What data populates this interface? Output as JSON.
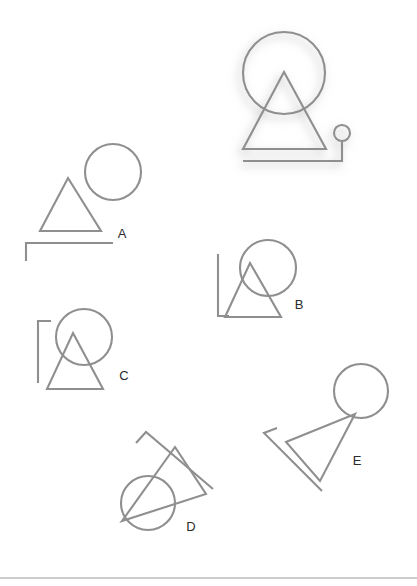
{
  "page": {
    "background_color": "#ffffff",
    "stroke_color": "#8f8f8f",
    "label_color": "#2b2b2b",
    "footer_rule_color": "#bdbdbd",
    "width": 417,
    "height": 586
  },
  "reference": {
    "name": "reference-figure",
    "has_shadow": true,
    "shadow_color": "#b0b0b0",
    "components": [
      {
        "type": "circle",
        "cx": 284,
        "cy": 73,
        "r": 41
      },
      {
        "type": "triangle",
        "apex_x": 284,
        "apex_y": 72,
        "left_x": 243,
        "right_x": 326,
        "base_y": 149
      },
      {
        "type": "line",
        "x1": 243,
        "y1": 161,
        "x2": 342,
        "y2": 161
      },
      {
        "type": "line",
        "x1": 342,
        "y1": 161,
        "x2": 342,
        "y2": 142
      },
      {
        "type": "circle",
        "cx": 342,
        "cy": 133,
        "r": 8
      }
    ]
  },
  "options": [
    {
      "id": "A",
      "label": "A",
      "label_x": 122,
      "label_y": 238,
      "description": "triangle with separate circle to upper right, horizontal bar below with downward tick at left end",
      "components": [
        {
          "type": "circle",
          "cx": 113,
          "cy": 172,
          "r": 28
        },
        {
          "type": "triangle",
          "apex_x": 68,
          "apex_y": 178,
          "left_x": 40,
          "right_x": 101,
          "base_y": 231
        },
        {
          "type": "line",
          "x1": 26,
          "y1": 243,
          "x2": 113,
          "y2": 243
        },
        {
          "type": "line",
          "x1": 26,
          "y1": 243,
          "x2": 26,
          "y2": 261
        }
      ]
    },
    {
      "id": "B",
      "label": "B",
      "label_x": 299,
      "label_y": 309,
      "description": "circle overlapping triangle apex, vertical bar at left with short foot at bottom",
      "components": [
        {
          "type": "circle",
          "cx": 268,
          "cy": 268,
          "r": 28
        },
        {
          "type": "triangle",
          "apex_x": 250,
          "apex_y": 263,
          "left_x": 225,
          "right_x": 281,
          "base_y": 317
        },
        {
          "type": "line",
          "x1": 218,
          "y1": 254,
          "x2": 218,
          "y2": 316
        },
        {
          "type": "line",
          "x1": 218,
          "y1": 316,
          "x2": 228,
          "y2": 316
        }
      ]
    },
    {
      "id": "C",
      "label": "C",
      "label_x": 124,
      "label_y": 380,
      "description": "circle overlapping triangle apex, vertical bar at left with short foot at top",
      "components": [
        {
          "type": "circle",
          "cx": 84,
          "cy": 337,
          "r": 28
        },
        {
          "type": "triangle",
          "apex_x": 73,
          "apex_y": 333,
          "left_x": 47,
          "right_x": 103,
          "base_y": 389
        },
        {
          "type": "line",
          "x1": 38,
          "y1": 321,
          "x2": 38,
          "y2": 383
        },
        {
          "type": "line",
          "x1": 38,
          "y1": 321,
          "x2": 50,
          "y2": 321
        }
      ]
    },
    {
      "id": "D",
      "label": "D",
      "label_x": 191,
      "label_y": 531,
      "description": "rotated group: tilted triangle with circle overlapping lower-left vertex, tilted bar with angled tick",
      "rotation_deg": 140,
      "components": [
        {
          "type": "circle",
          "cx": 148,
          "cy": 503,
          "r": 27
        },
        {
          "type": "triangle",
          "p1_x": 175,
          "p1_y": 447,
          "p2_x": 206,
          "p2_y": 494,
          "p3_x": 122,
          "p3_y": 521
        },
        {
          "type": "line",
          "x1": 146,
          "y1": 432,
          "x2": 213,
          "y2": 489
        },
        {
          "type": "line",
          "x1": 146,
          "y1": 432,
          "x2": 137,
          "y2": 442
        }
      ]
    },
    {
      "id": "E",
      "label": "E",
      "label_x": 357,
      "label_y": 465,
      "description": "rotated group: triangle pointing left with circle at upper-right vertex, angled bar with tick",
      "rotation_deg": 250,
      "components": [
        {
          "type": "circle",
          "cx": 361,
          "cy": 391,
          "r": 27
        },
        {
          "type": "triangle",
          "p1_x": 355,
          "p1_y": 414,
          "p2_x": 286,
          "p2_y": 442,
          "p3_x": 320,
          "p3_y": 481
        },
        {
          "type": "line",
          "x1": 264,
          "y1": 433,
          "x2": 322,
          "y2": 491
        },
        {
          "type": "line",
          "x1": 264,
          "y1": 433,
          "x2": 276,
          "y2": 429
        }
      ]
    }
  ],
  "footer": {
    "rule_y": 578
  }
}
